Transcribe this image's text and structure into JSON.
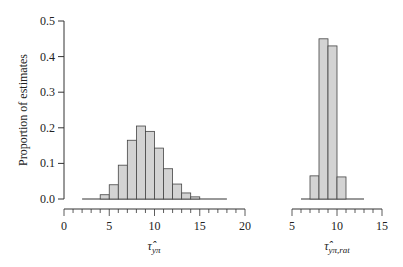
{
  "chart_data": [
    {
      "type": "bar",
      "title": "",
      "xlabel": "τ̂_{yπ}",
      "xlabel_main": "τ̂",
      "xlabel_sub": "yπ",
      "ylabel": "Proportion of estimates",
      "ylim": [
        0,
        0.5
      ],
      "xlim": [
        0,
        20
      ],
      "yticks": [
        "0.0",
        "0.1",
        "0.2",
        "0.3",
        "0.4",
        "0.5"
      ],
      "xticks": [
        "0",
        "5",
        "10",
        "15",
        "20"
      ],
      "bin_width": 1,
      "bin_starts": [
        2,
        3,
        4,
        5,
        6,
        7,
        8,
        9,
        10,
        11,
        12,
        13,
        14,
        15,
        16,
        17
      ],
      "values": [
        0.001,
        0.003,
        0.012,
        0.04,
        0.095,
        0.165,
        0.205,
        0.19,
        0.143,
        0.085,
        0.042,
        0.017,
        0.006,
        0.002,
        0.001,
        0.001
      ],
      "grid": false,
      "bar_color": "#d3d3d3"
    },
    {
      "type": "bar",
      "title": "",
      "xlabel": "τ̂_{yπ,rat}",
      "xlabel_main": "τ̂",
      "xlabel_sub": "yπ,rat",
      "ylabel": "Proportion of estimates",
      "ylim": [
        0,
        0.5
      ],
      "xlim": [
        5,
        15
      ],
      "xticks": [
        "5",
        "10",
        "15"
      ],
      "bin_width": 1,
      "bin_starts": [
        6,
        7,
        8,
        9,
        10,
        11,
        12
      ],
      "values": [
        0.001,
        0.065,
        0.45,
        0.43,
        0.062,
        0.001,
        0.001
      ],
      "grid": false,
      "bar_color": "#d3d3d3"
    }
  ]
}
